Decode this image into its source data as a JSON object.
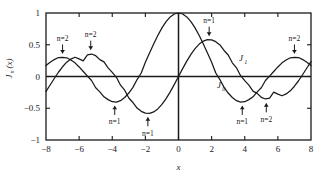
{
  "chart_data": {
    "type": "line",
    "title": "",
    "xlabel": "x",
    "ylabel": "J_n(x)",
    "ylabel_display": "J",
    "ylabel_sub": "n",
    "ylabel_tail": "(x)",
    "xlim": [
      -8,
      8
    ],
    "ylim": [
      -1,
      1
    ],
    "grid": false,
    "legend": "inline-curve-labels",
    "xticks": [
      -8,
      -6,
      -4,
      -2,
      0,
      2,
      4,
      6,
      8
    ],
    "xtick_labels": [
      "-8",
      "-6",
      "-4",
      "-2",
      "0",
      "2",
      "4",
      "6",
      "8"
    ],
    "yticks": [
      -1,
      -0.5,
      0,
      0.5,
      1
    ],
    "ytick_labels": [
      "-1",
      "-0.5",
      "0",
      "0.5",
      "1"
    ],
    "series": [
      {
        "name": "J0",
        "label": "J",
        "label_sub": "0",
        "x": [
          -8,
          -7.75,
          -7.5,
          -7.25,
          -7,
          -6.75,
          -6.5,
          -6.25,
          -6,
          -5.75,
          -5.5,
          -5.25,
          -5,
          -4.75,
          -4.5,
          -4.25,
          -4,
          -3.75,
          -3.5,
          -3.25,
          -3,
          -2.75,
          -2.5,
          -2.25,
          -2,
          -1.75,
          -1.5,
          -1.25,
          -1,
          -0.75,
          -0.5,
          -0.25,
          0,
          0.25,
          0.5,
          0.75,
          1,
          1.25,
          1.5,
          1.75,
          2,
          2.25,
          2.5,
          2.75,
          3,
          3.25,
          3.5,
          3.75,
          4,
          4.25,
          4.5,
          4.75,
          5,
          5.25,
          5.5,
          5.75,
          6,
          6.25,
          6.5,
          6.75,
          7,
          7.25,
          7.5,
          7.75,
          8
        ],
        "y": [
          0.1717,
          0.2235,
          0.2663,
          0.2991,
          0.3001,
          0.2951,
          0.2601,
          0.2154,
          0.1506,
          0.0788,
          0.0068,
          -0.0632,
          -0.1776,
          -0.2414,
          -0.3205,
          -0.3643,
          -0.3971,
          -0.4026,
          -0.3801,
          -0.3305,
          -0.2601,
          -0.1712,
          -0.0484,
          0.0555,
          0.2239,
          0.369,
          0.5118,
          0.6459,
          0.7652,
          0.8642,
          0.9385,
          0.9844,
          1.0,
          0.9844,
          0.9385,
          0.8642,
          0.7652,
          0.6459,
          0.5118,
          0.369,
          0.2239,
          0.0555,
          -0.0484,
          -0.1712,
          -0.2601,
          -0.3305,
          -0.3801,
          -0.4026,
          -0.3971,
          -0.3643,
          -0.3205,
          -0.2414,
          -0.1776,
          -0.0632,
          0.0068,
          0.0788,
          0.1506,
          0.2154,
          0.2601,
          0.2951,
          0.3001,
          0.2991,
          0.2663,
          0.2235,
          0.1717
        ]
      },
      {
        "name": "J1",
        "label": "J",
        "label_sub": "1",
        "x": [
          -8,
          -7.75,
          -7.5,
          -7.25,
          -7,
          -6.75,
          -6.5,
          -6.25,
          -6,
          -5.75,
          -5.5,
          -5.25,
          -5,
          -4.75,
          -4.5,
          -4.25,
          -4,
          -3.75,
          -3.5,
          -3.25,
          -3,
          -2.75,
          -2.5,
          -2.25,
          -2,
          -1.75,
          -1.5,
          -1.25,
          -1,
          -0.75,
          -0.5,
          -0.25,
          0,
          0.25,
          0.5,
          0.75,
          1,
          1.25,
          1.5,
          1.75,
          2,
          2.25,
          2.5,
          2.75,
          3,
          3.25,
          3.5,
          3.75,
          4,
          4.25,
          4.5,
          4.75,
          5,
          5.25,
          5.5,
          5.75,
          6,
          6.25,
          6.5,
          6.75,
          7,
          7.25,
          7.5,
          7.75,
          8
        ],
        "y": [
          -0.2346,
          -0.1334,
          -0.0319,
          0.067,
          0.1534,
          0.2254,
          0.2741,
          0.3032,
          0.2767,
          0.2466,
          0.3414,
          0.354,
          0.3276,
          0.2661,
          0.2311,
          0.1366,
          0.066,
          -0.0128,
          -0.1374,
          -0.2155,
          -0.3391,
          -0.4097,
          -0.4971,
          -0.5484,
          -0.5767,
          -0.5802,
          -0.5579,
          -0.5106,
          -0.4401,
          -0.3492,
          -0.2423,
          -0.124,
          0.0,
          0.124,
          0.2423,
          0.3492,
          0.4401,
          0.5106,
          0.5579,
          0.5802,
          0.5767,
          0.5484,
          0.4971,
          0.4097,
          0.3391,
          0.2155,
          0.1374,
          0.0128,
          -0.066,
          -0.1366,
          -0.2311,
          -0.2661,
          -0.3276,
          -0.354,
          -0.3414,
          -0.2466,
          -0.2767,
          -0.3032,
          -0.2741,
          -0.2254,
          -0.1534,
          -0.067,
          0.0319,
          0.1334,
          0.2346
        ]
      }
    ],
    "annotations": [
      {
        "text": "n=2",
        "x": -7.0,
        "y": 0.3,
        "direction": "down"
      },
      {
        "text": "n=2",
        "x": -5.3,
        "y": 0.36,
        "direction": "down"
      },
      {
        "text": "n=1",
        "x": -3.85,
        "y": -0.4,
        "direction": "up"
      },
      {
        "text": "n=1",
        "x": -1.85,
        "y": -0.58,
        "direction": "up"
      },
      {
        "text": "n=1",
        "x": 1.85,
        "y": 0.58,
        "direction": "down"
      },
      {
        "text": "n=1",
        "x": 3.85,
        "y": -0.4,
        "direction": "up"
      },
      {
        "text": "n=2",
        "x": 5.3,
        "y": -0.36,
        "direction": "up"
      },
      {
        "text": "n=2",
        "x": 7.0,
        "y": 0.3,
        "direction": "down"
      }
    ]
  }
}
